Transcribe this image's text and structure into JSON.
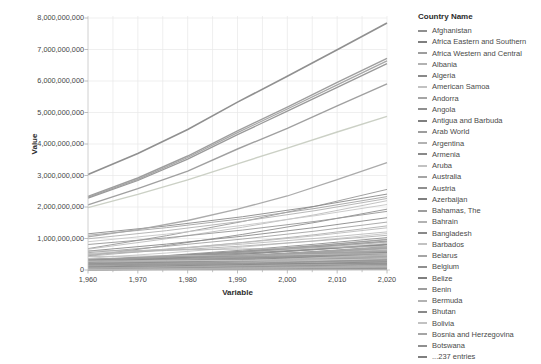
{
  "chart_data": {
    "type": "line",
    "title": "",
    "xlabel": "Variable",
    "ylabel": "Value",
    "xlim": [
      1960,
      2020
    ],
    "ylim": [
      0,
      8000000000
    ],
    "grid": true,
    "legend_position": "right",
    "x_tick_labels": [
      "1,960",
      "1,970",
      "1,980",
      "1,990",
      "2,000",
      "2,010",
      "2,020"
    ],
    "y_tick_labels": [
      "0",
      "1,000,000,000",
      "2,000,000,000",
      "3,000,000,000",
      "4,000,000,000",
      "5,000,000,000",
      "6,000,000,000",
      "7,000,000,000",
      "8,000,000,000"
    ],
    "x_decades": [
      1960,
      1970,
      1980,
      1990,
      2000,
      2010,
      2020
    ],
    "x_minor_ticks": [
      1965,
      1975,
      1985,
      1995,
      2005,
      2015
    ],
    "unit": "billions",
    "prominent_series": [
      {
        "name": "series-1",
        "values_billions": [
          3.03,
          3.7,
          4.46,
          5.33,
          6.15,
          6.99,
          7.84
        ],
        "color": "#8a8a8a",
        "width": 1.6
      },
      {
        "name": "series-2",
        "values_billions": [
          2.34,
          2.92,
          3.62,
          4.42,
          5.17,
          5.96,
          6.72
        ],
        "color": "#999999",
        "width": 1.4
      },
      {
        "name": "series-3",
        "values_billions": [
          2.31,
          2.88,
          3.57,
          4.36,
          5.11,
          5.88,
          6.64
        ],
        "color": "#a2a2a2",
        "width": 1.3
      },
      {
        "name": "series-4",
        "values_billions": [
          2.28,
          2.84,
          3.52,
          4.3,
          5.04,
          5.8,
          6.55
        ],
        "color": "#939393",
        "width": 1.3
      },
      {
        "name": "series-5",
        "values_billions": [
          2.07,
          2.58,
          3.14,
          3.84,
          4.5,
          5.21,
          5.91
        ],
        "color": "#9b9b9b",
        "width": 1.4
      },
      {
        "name": "series-6",
        "values_billions": [
          1.98,
          2.4,
          2.86,
          3.37,
          3.87,
          4.38,
          4.88
        ],
        "color": "#c8cec2",
        "width": 1.4
      },
      {
        "name": "series-7",
        "values_billions": [
          1.05,
          1.28,
          1.57,
          1.93,
          2.35,
          2.87,
          3.41
        ],
        "color": "#a6a6a6",
        "width": 1.3
      }
    ],
    "mid_lines": [
      {
        "v1960": 0.68,
        "v2020": 2.56
      },
      {
        "v1960": 1.15,
        "v2020": 2.41
      },
      {
        "v1960": 1.1,
        "v2020": 2.33
      },
      {
        "v1960": 0.99,
        "v2020": 2.27
      },
      {
        "v1960": 0.66,
        "v2020": 2.2
      },
      {
        "v1960": 0.9,
        "v2020": 2.08
      },
      {
        "v1960": 0.45,
        "v2020": 1.93
      },
      {
        "v1960": 0.81,
        "v2020": 1.86
      },
      {
        "v1960": 0.6,
        "v2020": 1.66
      },
      {
        "v1960": 0.55,
        "v2020": 1.52
      },
      {
        "v1960": 0.44,
        "v2020": 1.4
      },
      {
        "v1960": 0.48,
        "v2020": 1.34
      },
      {
        "v1960": 0.37,
        "v2020": 1.16
      },
      {
        "v1960": 0.3,
        "v2020": 1.03
      },
      {
        "v1960": 0.28,
        "v2020": 0.92
      },
      {
        "v1960": 0.25,
        "v2020": 0.81
      },
      {
        "v1960": 0.22,
        "v2020": 0.7
      },
      {
        "v1960": 0.6,
        "v2020": 0.75
      },
      {
        "v1960": 0.43,
        "v2020": 0.52
      },
      {
        "v1960": 0.28,
        "v2020": 0.34
      },
      {
        "v1960": 0.18,
        "v2020": 0.21
      },
      {
        "v1960": 0.12,
        "v2020": 0.33
      },
      {
        "v1960": 0.1,
        "v2020": 0.26
      },
      {
        "v1960": 0.35,
        "v2020": 0.6
      },
      {
        "v1960": 0.5,
        "v2020": 1.1
      },
      {
        "v1960": 0.52,
        "v2020": 1.21
      }
    ],
    "dense_band": {
      "count": 170,
      "seed": 7,
      "start_min": 0.004,
      "start_max": 0.34,
      "end_max": 1.4
    },
    "line_palette": [
      "#979797",
      "#8a8a8a",
      "#a3a3a3",
      "#b0b0b0",
      "#bcbcbc",
      "#c7c7c7",
      "#8f8f8f"
    ]
  },
  "legend": {
    "title": "Country Name",
    "more_label": "...237 entries",
    "swatch_palette": [
      "#8f8f8f",
      "#7f7f7f",
      "#9d9d9d",
      "#b2b2b2",
      "#898989",
      "#c2c2c2",
      "#a5a5a5"
    ],
    "items": [
      {
        "label": "Afghanistan"
      },
      {
        "label": "Africa Eastern and Southern"
      },
      {
        "label": "Africa Western and Central"
      },
      {
        "label": "Albania"
      },
      {
        "label": "Algeria"
      },
      {
        "label": "American Samoa"
      },
      {
        "label": "Andorra"
      },
      {
        "label": "Angola"
      },
      {
        "label": "Antigua and Barbuda"
      },
      {
        "label": "Arab World"
      },
      {
        "label": "Argentina"
      },
      {
        "label": "Armenia"
      },
      {
        "label": "Aruba"
      },
      {
        "label": "Australia"
      },
      {
        "label": "Austria"
      },
      {
        "label": "Azerbaijan"
      },
      {
        "label": "Bahamas, The"
      },
      {
        "label": "Bahrain"
      },
      {
        "label": "Bangladesh"
      },
      {
        "label": "Barbados"
      },
      {
        "label": "Belarus"
      },
      {
        "label": "Belgium"
      },
      {
        "label": "Belize"
      },
      {
        "label": "Benin"
      },
      {
        "label": "Bermuda"
      },
      {
        "label": "Bhutan"
      },
      {
        "label": "Bolivia"
      },
      {
        "label": "Bosnia and Herzegovina"
      },
      {
        "label": "Botswana"
      },
      {
        "label": "...237 entries"
      }
    ]
  },
  "colors": {
    "background": "#ffffff",
    "grid": "#e8e8e8",
    "axis": "#c4c4c4",
    "tick": "#adadad",
    "tick_text": "#454545",
    "axis_title_text": "#2d2d2d",
    "legend_text": "#4a4a4a"
  }
}
